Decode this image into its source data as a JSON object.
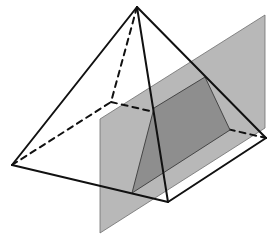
{
  "diagram": {
    "colors": {
      "background": "#ffffff",
      "plane_fill": "#b8b8b8",
      "plane_stroke": "#6e6e6e",
      "section_fill": "#8e8e8e",
      "section_stroke": "#3a3a3a",
      "edge_stroke": "#111111"
    },
    "pyramid": {
      "apex": [
        137,
        7
      ],
      "base": {
        "left": [
          12,
          165
        ],
        "front": [
          168,
          202
        ],
        "right": [
          266,
          138
        ],
        "back": [
          111,
          102
        ]
      },
      "visible_edges": [
        {
          "name": "apex-left",
          "from": "apex",
          "to": "left"
        },
        {
          "name": "apex-front",
          "from": "apex",
          "to": "front"
        },
        {
          "name": "apex-right",
          "from": "apex",
          "to": "right"
        },
        {
          "name": "left-front",
          "from": "left",
          "to": "front"
        },
        {
          "name": "front-right",
          "from": "front",
          "to": "right"
        }
      ],
      "hidden_edges": [
        {
          "name": "apex-back",
          "from": "apex",
          "to": "back"
        },
        {
          "name": "left-back",
          "from": "left",
          "to": "back"
        },
        {
          "name": "back-right",
          "from": "back",
          "to": "right"
        }
      ]
    },
    "plane": {
      "corners": [
        [
          100,
          119
        ],
        [
          265,
          15
        ],
        [
          265,
          128
        ],
        [
          100,
          233
        ]
      ]
    },
    "cross_section": {
      "corners": [
        [
          154,
          108
        ],
        [
          205,
          77
        ],
        [
          230,
          130
        ],
        [
          132,
          193
        ]
      ]
    }
  }
}
